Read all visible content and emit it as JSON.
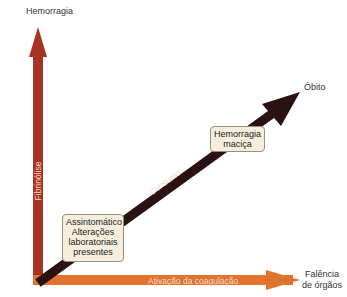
{
  "labels": {
    "y_axis_top": "Hemorragia",
    "y_axis_inner": "Fibrinólise",
    "x_axis_inner": "Ativação da coagulação",
    "x_axis_end_line1": "Falência",
    "x_axis_end_line2": "de órgãos",
    "diagonal_inner": "Consumo",
    "diagonal_end": "Óbito"
  },
  "boxes": {
    "early": {
      "line1": "Assintomático",
      "line2": "Alterações",
      "line3": "laboratoriais",
      "line4": "presentes"
    },
    "late": {
      "line1": "Hemorragia",
      "line2": "maciça"
    }
  },
  "colors": {
    "vertical_arrow": "#a93226",
    "horizontal_arrow": "#e0742e",
    "diagonal_arrow": "#2a1112",
    "box_fill": "#f6eedc"
  }
}
